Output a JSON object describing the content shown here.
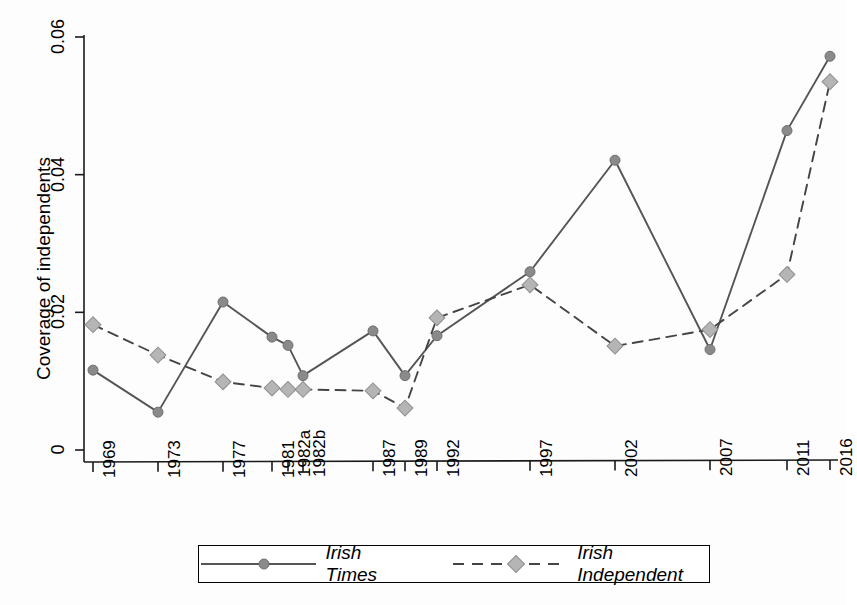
{
  "chart_data": {
    "type": "line",
    "title": "",
    "xlabel": "",
    "ylabel": "Coverage of independents",
    "categories": [
      "1969",
      "1973",
      "1977",
      "1981",
      "1982a",
      "1982b",
      "1987",
      "1989",
      "1992",
      "1997",
      "2002",
      "2007",
      "2011",
      "2016"
    ],
    "ylim": [
      0,
      0.06
    ],
    "yticks": [
      "0",
      "0.02",
      "0.04",
      "0.06"
    ],
    "ytick_values": [
      0,
      0.02,
      0.04,
      0.06
    ],
    "grid": false,
    "legend_position": "bottom",
    "series": [
      {
        "name": "Irish Times",
        "line_style": "solid",
        "marker": "circle",
        "color": "#555555",
        "marker_color": "#8a8a8a",
        "values": [
          0.0116,
          0.0055,
          0.0215,
          0.0164,
          0.0152,
          0.0108,
          0.0173,
          0.0108,
          0.0166,
          0.0259,
          0.0421,
          0.0146,
          0.0464,
          0.0572
        ]
      },
      {
        "name": "Irish Independent",
        "line_style": "dashed",
        "marker": "diamond",
        "color": "#444444",
        "marker_color": "#b5b5b5",
        "values": [
          0.0182,
          0.0138,
          0.0099,
          0.009,
          0.0088,
          0.0088,
          0.0086,
          0.0061,
          0.0192,
          0.024,
          0.0151,
          0.0175,
          0.0255,
          0.0535
        ]
      }
    ]
  },
  "legend": {
    "entries": [
      {
        "label": "Irish Times"
      },
      {
        "label": "Irish Independent"
      }
    ]
  },
  "axes": {
    "y_title": "Coverage of independents"
  }
}
